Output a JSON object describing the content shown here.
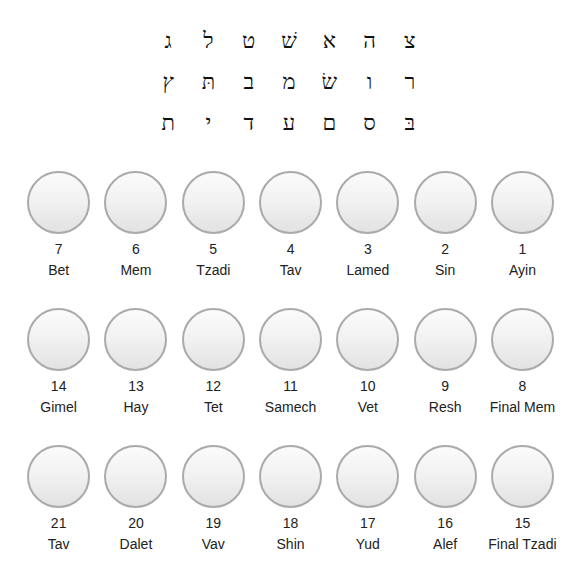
{
  "letter_grid": {
    "rows": [
      [
        "ג",
        "ל",
        "ט",
        "שׁ",
        "א",
        "ה",
        "צ"
      ],
      [
        "ץ",
        "תּ",
        "ב",
        "מ",
        "שׂ",
        "ו",
        "ר"
      ],
      [
        "ת",
        "י",
        "ד",
        "ע",
        "ם",
        "ס",
        "בּ"
      ]
    ]
  },
  "circle_rows": [
    [
      {
        "number": "7",
        "name": "Bet"
      },
      {
        "number": "6",
        "name": "Mem"
      },
      {
        "number": "5",
        "name": "Tzadi"
      },
      {
        "number": "4",
        "name": "Tav"
      },
      {
        "number": "3",
        "name": "Lamed"
      },
      {
        "number": "2",
        "name": "Sin"
      },
      {
        "number": "1",
        "name": "Ayin"
      }
    ],
    [
      {
        "number": "14",
        "name": "Gimel"
      },
      {
        "number": "13",
        "name": "Hay"
      },
      {
        "number": "12",
        "name": "Tet"
      },
      {
        "number": "11",
        "name": "Samech"
      },
      {
        "number": "10",
        "name": "Vet"
      },
      {
        "number": "9",
        "name": "Resh"
      },
      {
        "number": "8",
        "name": "Final Mem"
      }
    ],
    [
      {
        "number": "21",
        "name": "Tav"
      },
      {
        "number": "20",
        "name": "Dalet"
      },
      {
        "number": "19",
        "name": "Vav"
      },
      {
        "number": "18",
        "name": "Shin"
      },
      {
        "number": "17",
        "name": "Yud"
      },
      {
        "number": "16",
        "name": "Alef"
      },
      {
        "number": "15",
        "name": "Final Tzadi"
      }
    ]
  ],
  "colors": {
    "circle_border": "#aaaaaa",
    "circle_fill_top": "#fbfbfb",
    "circle_fill_bottom": "#e2e2e2",
    "text": "#222222"
  }
}
